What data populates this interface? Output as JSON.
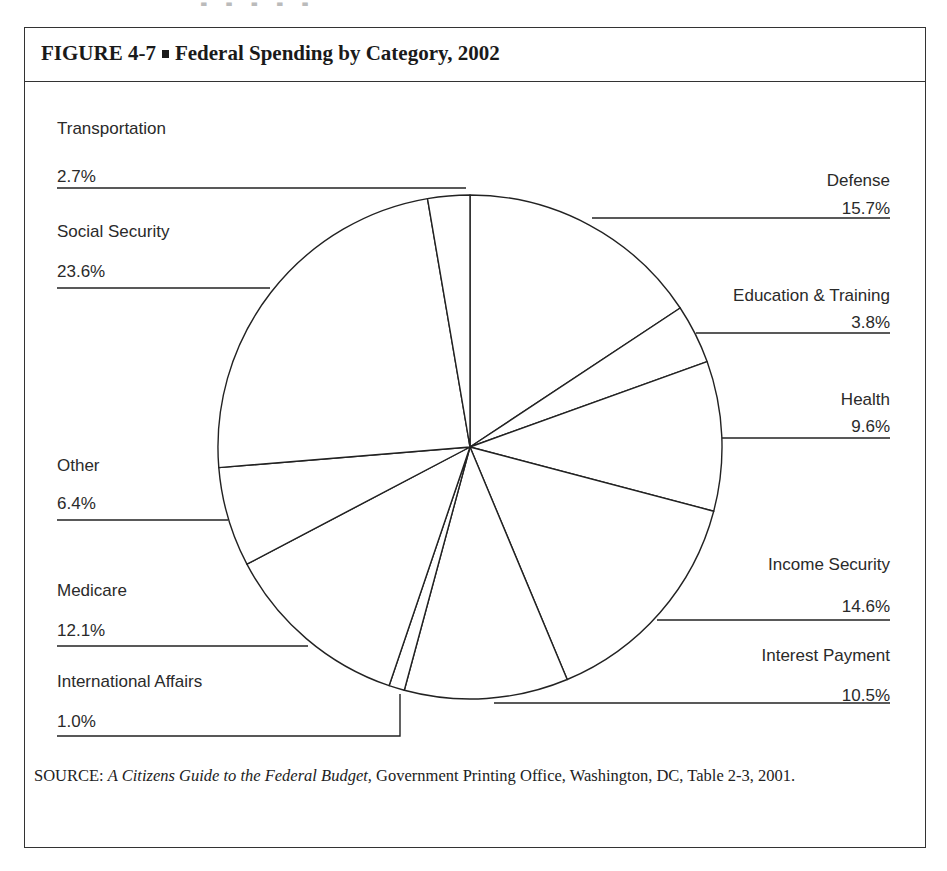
{
  "figure": {
    "number": "FIGURE 4-7",
    "title": "Federal Spending by Category, 2002"
  },
  "source": {
    "prefix": "SOURCE: ",
    "title_italic": "A Citizens Guide to the Federal Budget,",
    "rest": " Government Printing Office, Washington, DC, Table 2-3, 2001."
  },
  "chart_data": {
    "type": "pie",
    "title": "Federal Spending by Category, 2002",
    "start_angle": "12 o'clock",
    "direction": "clockwise",
    "unit": "%",
    "categories": [
      "Defense",
      "Education & Training",
      "Health",
      "Income Security",
      "Interest Payment",
      "International Affairs",
      "Medicare",
      "Other",
      "Social Security",
      "Transportation"
    ],
    "values": [
      15.7,
      3.8,
      9.6,
      14.6,
      10.5,
      1.0,
      12.1,
      6.4,
      23.6,
      2.7
    ],
    "value_labels": [
      "15.7%",
      "3.8%",
      "9.6%",
      "14.6%",
      "10.5%",
      "1.0%",
      "12.1%",
      "6.4%",
      "23.6%",
      "2.7%"
    ],
    "label_layout": {
      "right": [
        "Defense",
        "Education & Training",
        "Health",
        "Income Security",
        "Interest Payment"
      ],
      "left": [
        "Transportation",
        "Social Security",
        "Other",
        "Medicare",
        "International Affairs"
      ]
    },
    "fill": "#ffffff",
    "stroke": "#222222",
    "legend": "none (leader-line labels)"
  }
}
